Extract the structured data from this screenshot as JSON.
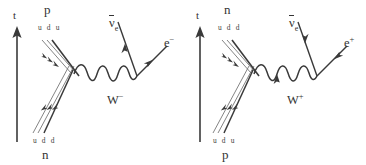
{
  "figure": {
    "background_color": "#ffffff",
    "line_color": "#3a3a3a",
    "text_color": "#343434",
    "width": 366,
    "height": 165
  },
  "axis": {
    "label": "t",
    "name": "time-axis",
    "direction": "up",
    "arrow_icon": "up-arrow-icon"
  },
  "diagrams": [
    {
      "id": "beta-minus",
      "name": "beta-minus-decay-diagram",
      "process": "n to p + e- + anti-nu-e",
      "top_hadron": {
        "label": "p",
        "quarks": "u d u",
        "name": "proton"
      },
      "bottom_hadron": {
        "label": "n",
        "quarks": "u d d",
        "name": "neutron"
      },
      "boson": {
        "symbol": "W",
        "charge": "−",
        "name": "w-minus-boson"
      },
      "lepton_upper": {
        "symbol": "ν",
        "overbar": true,
        "subscript": "e",
        "name": "electron-antineutrino"
      },
      "lepton_lower": {
        "symbol": "e",
        "charge": "−",
        "name": "electron"
      }
    },
    {
      "id": "beta-plus",
      "name": "beta-plus-decay-diagram",
      "process": "p to n + e+ + anti-nu-e",
      "top_hadron": {
        "label": "n",
        "quarks": "u d d",
        "name": "neutron"
      },
      "bottom_hadron": {
        "label": "p",
        "quarks": "u d u",
        "name": "proton"
      },
      "boson": {
        "symbol": "W",
        "charge": "+",
        "name": "w-plus-boson"
      },
      "lepton_upper": {
        "symbol": "ν",
        "overbar": true,
        "subscript": "e",
        "name": "electron-antineutrino"
      },
      "lepton_lower": {
        "symbol": "e",
        "charge": "+",
        "name": "positron"
      }
    }
  ]
}
